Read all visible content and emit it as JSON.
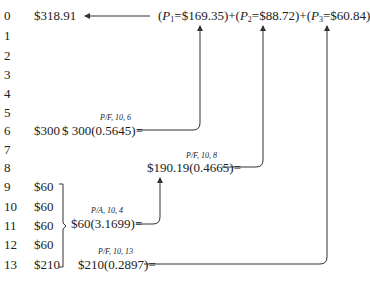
{
  "diagram": {
    "type": "cash-flow-discounting",
    "result": {
      "year": "0",
      "value": "$318.91"
    },
    "sum_expression": {
      "p1": {
        "label": "P",
        "sub": "1",
        "value": "=$169.35)"
      },
      "p2": {
        "label": "P",
        "sub": "2",
        "value": "=$88.72)"
      },
      "p3": {
        "label": "P",
        "sub": "3",
        "value": "=$60.84)"
      },
      "plus": "+",
      "open": "("
    },
    "years": [
      "0",
      "1",
      "2",
      "3",
      "4",
      "5",
      "6",
      "7",
      "8",
      "9",
      "10",
      "11",
      "12",
      "13"
    ],
    "cash_flows": [
      {
        "year": "6",
        "amount": "$300"
      },
      {
        "year": "9",
        "amount": "$60"
      },
      {
        "year": "10",
        "amount": "$60"
      },
      {
        "year": "11",
        "amount": "$60"
      },
      {
        "year": "12",
        "amount": "$60"
      },
      {
        "year": "13",
        "amount": "$210"
      }
    ],
    "equations": [
      {
        "factor": "P/F, 10, 6",
        "expr": "$ 300(0.5645)="
      },
      {
        "factor": "P/F, 10, 8",
        "expr": "$190.19(0.4665)="
      },
      {
        "factor": "P/A, 10, 4",
        "expr": "$60(3.1699)="
      },
      {
        "factor": "P/F, 10, 13",
        "expr": "$210(0.2897)="
      }
    ]
  }
}
